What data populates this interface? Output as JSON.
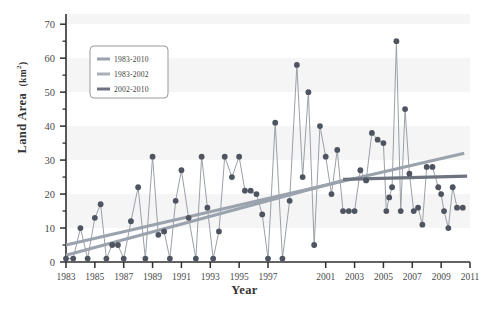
{
  "chart_data": {
    "type": "line",
    "title": "",
    "xlabel": "Year",
    "ylabel": "Land Area",
    "ylabel_unit": "km",
    "ylabel_unit_exp": "2",
    "ylim": [
      0,
      73
    ],
    "xlim": [
      1983,
      2011
    ],
    "y_ticks": [
      0,
      10,
      20,
      30,
      40,
      50,
      60,
      70
    ],
    "y_minor_ticks": [
      5,
      15,
      25,
      35,
      45,
      55,
      65
    ],
    "x_ticks": [
      1983,
      1985,
      1987,
      1989,
      1991,
      1993,
      1995,
      1997,
      2001,
      2003,
      2005,
      2007,
      2009,
      2011
    ],
    "x_tick_labels": [
      "1983",
      "1985",
      "1987",
      "1989",
      "1991",
      "1993",
      "1995",
      "1997",
      "2001",
      "2003",
      "2005",
      "2007",
      "2009",
      "2011"
    ],
    "grid": "horizontal-bands",
    "legend_position": "top-left",
    "marker": "filled-circle",
    "marker_color": "#4e5560",
    "series_line_color": "#9aa0a8",
    "series": [
      {
        "name": "Land Area observations",
        "x": [
          1983.0,
          1983.5,
          1984.0,
          1984.5,
          1985.0,
          1985.4,
          1985.8,
          1986.2,
          1986.6,
          1987.0,
          1987.5,
          1988.0,
          1988.5,
          1989.0,
          1989.4,
          1989.8,
          1990.2,
          1990.6,
          1991.0,
          1991.5,
          1992.0,
          1992.4,
          1992.8,
          1993.2,
          1993.6,
          1994.0,
          1994.5,
          1995.0,
          1995.4,
          1995.8,
          1996.2,
          1996.6,
          1997.0,
          1997.5,
          1998.0,
          1998.5,
          1999.0,
          1999.4,
          1999.8,
          2000.2,
          2000.6,
          2001.0,
          2001.4,
          2001.8,
          2002.2,
          2002.6,
          2003.0,
          2003.4,
          2003.8,
          2004.2,
          2004.6,
          2005.0,
          2005.2,
          2005.4,
          2005.6,
          2005.9,
          2006.2,
          2006.5,
          2006.8,
          2007.1,
          2007.4,
          2007.7,
          2008.0,
          2008.4,
          2008.8,
          2009.0,
          2009.2,
          2009.5,
          2009.8,
          2010.1,
          2010.5
        ],
        "y": [
          1.0,
          1.0,
          10.0,
          1.0,
          13.0,
          17.0,
          1.0,
          5.0,
          5.0,
          1.0,
          12.0,
          22.0,
          1.0,
          31.0,
          8.0,
          9.0,
          1.0,
          18.0,
          27.0,
          13.0,
          1.0,
          31.0,
          16.0,
          1.0,
          9.0,
          31.0,
          25.0,
          31.0,
          21.0,
          21.0,
          20.0,
          14.0,
          1.0,
          41.0,
          1.0,
          18.0,
          58.0,
          25.0,
          50.0,
          5.0,
          40.0,
          31.0,
          20.0,
          33.0,
          15.0,
          15.0,
          15.0,
          27.0,
          24.0,
          38.0,
          36.0,
          35.0,
          15.0,
          19.0,
          22.0,
          65.0,
          15.0,
          45.0,
          26.0,
          15.0,
          16.0,
          11.0,
          28.0,
          28.0,
          22.0,
          20.0,
          15.0,
          10.0,
          22.0,
          16.0,
          16.0
        ]
      }
    ],
    "trend_lines": [
      {
        "name": "1983-2010",
        "color": "#9aa3ad",
        "x0": 1983,
        "y0": 5.0,
        "x1": 2010.6,
        "y1": 32.0,
        "width": 3.2
      },
      {
        "name": "1983-2002",
        "color": "#9aa3ad",
        "x0": 1983,
        "y0": 2.0,
        "x1": 2002.2,
        "y1": 24.0,
        "width": 3.2
      },
      {
        "name": "2002-2010",
        "color": "#6d7480",
        "x0": 2002.2,
        "y0": 24.3,
        "x1": 2010.8,
        "y1": 25.3,
        "width": 3.2
      }
    ],
    "legend": {
      "entries": [
        {
          "label": "1983-2010",
          "color": "#9aa3ad"
        },
        {
          "label": "1983-2002",
          "color": "#a8b0b8"
        },
        {
          "label": "2002-2010",
          "color": "#6d7480"
        }
      ]
    }
  }
}
